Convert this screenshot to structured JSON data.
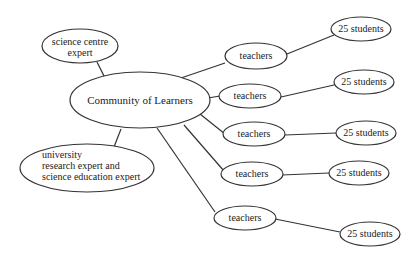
{
  "diagram": {
    "type": "concept-map",
    "center": {
      "id": "col",
      "label": "Community of Learners"
    },
    "nodes": [
      {
        "id": "sce",
        "lines": [
          "science centre",
          "expert"
        ]
      },
      {
        "id": "col",
        "lines": [
          "Community of Learners"
        ]
      },
      {
        "id": "uni",
        "lines": [
          "university",
          "research expert and",
          "science education expert"
        ]
      },
      {
        "id": "t1",
        "lines": [
          "teachers"
        ]
      },
      {
        "id": "t2",
        "lines": [
          "teachers"
        ]
      },
      {
        "id": "t3",
        "lines": [
          "teachers"
        ]
      },
      {
        "id": "t4",
        "lines": [
          "teachers"
        ]
      },
      {
        "id": "t5",
        "lines": [
          "teachers"
        ]
      },
      {
        "id": "s1",
        "lines": [
          "25 students"
        ]
      },
      {
        "id": "s2",
        "lines": [
          "25 students"
        ]
      },
      {
        "id": "s3",
        "lines": [
          "25 students"
        ]
      },
      {
        "id": "s4",
        "lines": [
          "25 students"
        ]
      },
      {
        "id": "s5",
        "lines": [
          "25 students"
        ]
      }
    ],
    "edges": [
      [
        "col",
        "sce"
      ],
      [
        "col",
        "uni"
      ],
      [
        "col",
        "t1"
      ],
      [
        "col",
        "t2"
      ],
      [
        "col",
        "t3"
      ],
      [
        "col",
        "t4"
      ],
      [
        "col",
        "t5"
      ],
      [
        "t1",
        "s1"
      ],
      [
        "t2",
        "s2"
      ],
      [
        "t3",
        "s3"
      ],
      [
        "t4",
        "s4"
      ],
      [
        "t5",
        "s5"
      ]
    ]
  }
}
